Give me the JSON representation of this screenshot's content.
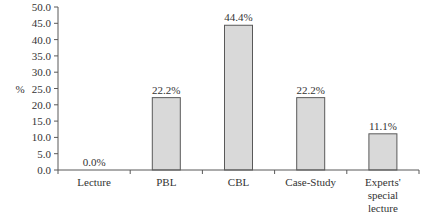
{
  "chart_data": {
    "type": "bar",
    "title": "",
    "xlabel": "",
    "ylabel": "%",
    "ylim": [
      0,
      50
    ],
    "yticks": [
      "0.0",
      "5.0",
      "10.0",
      "15.0",
      "20.0",
      "25.0",
      "30.0",
      "35.0",
      "40.0",
      "45.0",
      "50.0"
    ],
    "categories": [
      "Lecture",
      "PBL",
      "CBL",
      "Case-Study",
      "Experts' special lecture"
    ],
    "category_lines": [
      [
        "Lecture"
      ],
      [
        "PBL"
      ],
      [
        "CBL"
      ],
      [
        "Case-Study"
      ],
      [
        "Experts'",
        "special",
        "lecture"
      ]
    ],
    "values": [
      0.0,
      22.2,
      44.4,
      22.2,
      11.1
    ],
    "value_labels": [
      "0.0%",
      "22.2%",
      "44.4%",
      "22.2%",
      "11.1%"
    ],
    "grid": false,
    "legend": null,
    "colors": {
      "bar_fill": "#d9d9d9",
      "bar_stroke": "#595959",
      "axis": "#595959"
    }
  }
}
